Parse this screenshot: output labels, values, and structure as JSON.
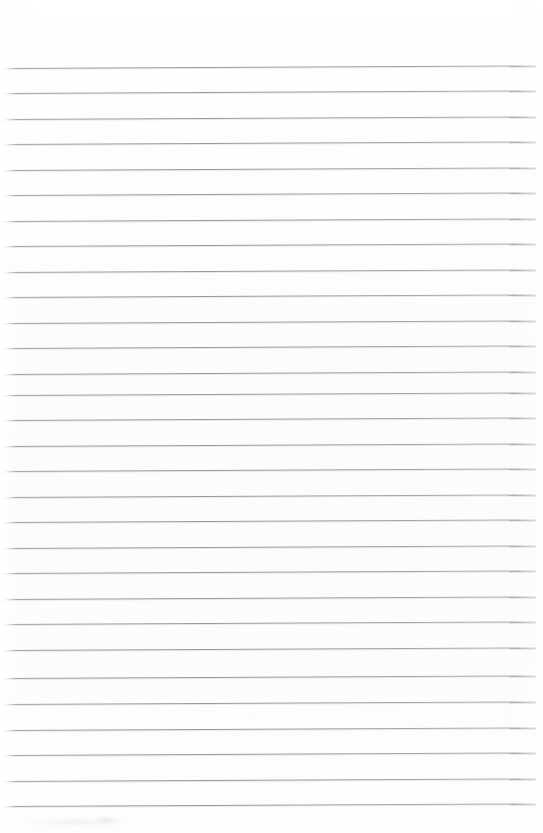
{
  "document": {
    "kind": "scanned-lined-notebook-page",
    "title": "Blank Ruled Page",
    "page_width": 543,
    "page_height": 833,
    "background_color": "#fdfdfd",
    "has_text_content": false,
    "text_content": "",
    "margin_top_px": 68,
    "margin_bottom_px": 27,
    "handwriting_present": "no"
  },
  "ruling": {
    "style": "horizontal ruled lines",
    "line_color": "#9a9aa1",
    "line_thickness_px": 1,
    "line_spacing_px": 25.5,
    "line_count": 30,
    "first_line_y": 68,
    "last_line_y": 806,
    "line_start_x": 2,
    "line_end_x": 536,
    "skew_degrees": -0.28,
    "lines": [
      {
        "index": 1,
        "y": 68,
        "x1": 2,
        "x2": 536
      },
      {
        "index": 2,
        "y": 93,
        "x1": 2,
        "x2": 536
      },
      {
        "index": 3,
        "y": 119,
        "x1": 2,
        "x2": 536
      },
      {
        "index": 4,
        "y": 144,
        "x1": 2,
        "x2": 536
      },
      {
        "index": 5,
        "y": 170,
        "x1": 2,
        "x2": 536
      },
      {
        "index": 6,
        "y": 195,
        "x1": 2,
        "x2": 536
      },
      {
        "index": 7,
        "y": 221,
        "x1": 2,
        "x2": 536
      },
      {
        "index": 8,
        "y": 246,
        "x1": 2,
        "x2": 536
      },
      {
        "index": 9,
        "y": 272,
        "x1": 2,
        "x2": 536
      },
      {
        "index": 10,
        "y": 297,
        "x1": 2,
        "x2": 536
      },
      {
        "index": 11,
        "y": 323,
        "x1": 2,
        "x2": 536
      },
      {
        "index": 12,
        "y": 348,
        "x1": 2,
        "x2": 536
      },
      {
        "index": 13,
        "y": 374,
        "x1": 2,
        "x2": 536
      },
      {
        "index": 14,
        "y": 395,
        "x1": 2,
        "x2": 536
      },
      {
        "index": 15,
        "y": 420,
        "x1": 2,
        "x2": 536
      },
      {
        "index": 16,
        "y": 446,
        "x1": 2,
        "x2": 536
      },
      {
        "index": 17,
        "y": 471,
        "x1": 2,
        "x2": 536
      },
      {
        "index": 18,
        "y": 497,
        "x1": 2,
        "x2": 536
      },
      {
        "index": 19,
        "y": 522,
        "x1": 2,
        "x2": 536
      },
      {
        "index": 20,
        "y": 548,
        "x1": 2,
        "x2": 536
      },
      {
        "index": 21,
        "y": 573,
        "x1": 2,
        "x2": 536
      },
      {
        "index": 22,
        "y": 599,
        "x1": 2,
        "x2": 536
      },
      {
        "index": 23,
        "y": 624,
        "x1": 2,
        "x2": 536
      },
      {
        "index": 24,
        "y": 650,
        "x1": 2,
        "x2": 536
      },
      {
        "index": 25,
        "y": 678,
        "x1": 2,
        "x2": 536
      },
      {
        "index": 26,
        "y": 704,
        "x1": 2,
        "x2": 536
      },
      {
        "index": 27,
        "y": 730,
        "x1": 2,
        "x2": 536
      },
      {
        "index": 28,
        "y": 755,
        "x1": 2,
        "x2": 536
      },
      {
        "index": 29,
        "y": 781,
        "x1": 2,
        "x2": 536
      },
      {
        "index": 30,
        "y": 806,
        "x1": 2,
        "x2": 536
      }
    ]
  },
  "artifacts": {
    "left_edge_wedge": {
      "x": 0,
      "y": 0,
      "width": 11,
      "height": 833
    },
    "bottom_smudge": {
      "x": 28,
      "y": 818,
      "width": 96,
      "height": 8
    },
    "bottom_smudge_secondary": {
      "x": 94,
      "y": 815,
      "width": 26,
      "height": 10
    }
  }
}
